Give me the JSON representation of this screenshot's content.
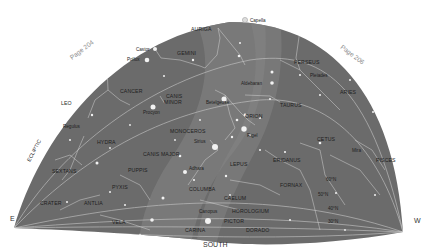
{
  "chart": {
    "colors": {
      "sky": "#6b6b6b",
      "milky_way": "#7e7e7e",
      "lines": "#cfcfcf",
      "stars": "#f2f2f2",
      "background": "#ffffff"
    },
    "page_refs": {
      "left": "Page 204",
      "right": "Page 206"
    },
    "directions": {
      "east": "E",
      "south": "SOUTH",
      "west": "W"
    },
    "ecliptic_label": "ECLIPTIC",
    "latitude_labels": [
      "60°N",
      "50°N",
      "40°N",
      "30°N"
    ],
    "constellations": [
      "AURIGA",
      "GEMINI",
      "PERSEUS",
      "CANCER",
      "CANIS MINOR",
      "LEO",
      "ARIES",
      "TAURUS",
      "ORION",
      "MONOCEROS",
      "HYDRA",
      "CETUS",
      "CANIS MAJOR",
      "LEPUS",
      "ERIDANUS",
      "PISCES",
      "SEXTANS",
      "PUPPIS",
      "PYXIS",
      "COLUMBA",
      "FORNAX",
      "CAELUM",
      "CRATER",
      "ANTLIA",
      "HOROLOGIUM",
      "VELA",
      "PICTOR",
      "CARINA",
      "DORADO"
    ],
    "stars": [
      "Capella",
      "Castor",
      "Pollux",
      "Pleiades",
      "Aldebaran",
      "Betelgeuse",
      "Procyon",
      "Regulus",
      "Rigel",
      "Sirius",
      "Adhara",
      "Mira",
      "Canopus"
    ]
  }
}
